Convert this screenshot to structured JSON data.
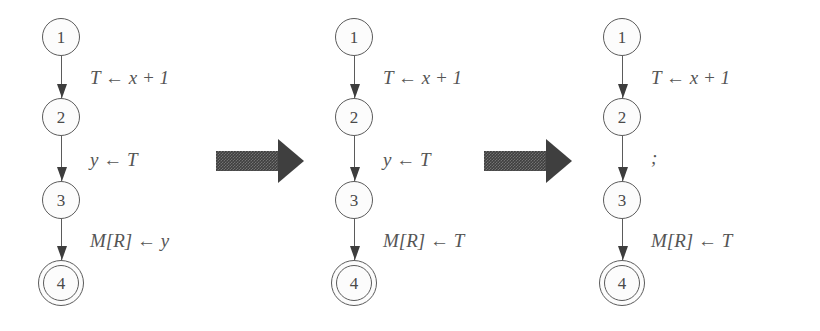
{
  "figure": {
    "background_color": "#ffffff",
    "node_stroke_color": "#5b5b5b",
    "label_color": "#555555",
    "block_arrow_color": "#3f3f3f"
  },
  "panels": [
    {
      "name": "original",
      "nodes": [
        {
          "id": "1",
          "label": "1",
          "accepting": false,
          "x": 61,
          "y": 37
        },
        {
          "id": "2",
          "label": "2",
          "accepting": false,
          "x": 61,
          "y": 117
        },
        {
          "id": "3",
          "label": "3",
          "accepting": false,
          "x": 61,
          "y": 200
        },
        {
          "id": "4",
          "label": "4",
          "accepting": true,
          "x": 61,
          "y": 283
        }
      ],
      "edges": [
        {
          "from": "1",
          "to": "2",
          "label": "T ← x + 1",
          "label_x": 90,
          "label_y": 68
        },
        {
          "from": "2",
          "to": "3",
          "label": "y ← T",
          "label_x": 90,
          "label_y": 150
        },
        {
          "from": "3",
          "to": "4",
          "label": "M[R] ← y",
          "label_x": 90,
          "label_y": 231
        }
      ]
    },
    {
      "name": "after-copy-propagation",
      "nodes": [
        {
          "id": "1",
          "label": "1",
          "accepting": false,
          "x": 354,
          "y": 37
        },
        {
          "id": "2",
          "label": "2",
          "accepting": false,
          "x": 354,
          "y": 117
        },
        {
          "id": "3",
          "label": "3",
          "accepting": false,
          "x": 354,
          "y": 200
        },
        {
          "id": "4",
          "label": "4",
          "accepting": true,
          "x": 354,
          "y": 283
        }
      ],
      "edges": [
        {
          "from": "1",
          "to": "2",
          "label": "T ← x + 1",
          "label_x": 383,
          "label_y": 68
        },
        {
          "from": "2",
          "to": "3",
          "label": "y ← T",
          "label_x": 383,
          "label_y": 150
        },
        {
          "from": "3",
          "to": "4",
          "label": "M[R] ← T",
          "label_x": 383,
          "label_y": 231
        }
      ]
    },
    {
      "name": "after-dead-code-elimination",
      "nodes": [
        {
          "id": "1",
          "label": "1",
          "accepting": false,
          "x": 622,
          "y": 37
        },
        {
          "id": "2",
          "label": "2",
          "accepting": false,
          "x": 622,
          "y": 117
        },
        {
          "id": "3",
          "label": "3",
          "accepting": false,
          "x": 622,
          "y": 200
        },
        {
          "id": "4",
          "label": "4",
          "accepting": true,
          "x": 622,
          "y": 283
        }
      ],
      "edges": [
        {
          "from": "1",
          "to": "2",
          "label": "T ← x + 1",
          "label_x": 651,
          "label_y": 68
        },
        {
          "from": "2",
          "to": "3",
          "label": ";",
          "label_x": 651,
          "label_y": 150
        },
        {
          "from": "3",
          "to": "4",
          "label": "M[R] ← T",
          "label_x": 651,
          "label_y": 231
        }
      ]
    }
  ],
  "transitions": [
    {
      "name": "transition-arrow-1",
      "x": 216,
      "y": 139,
      "shaft_width": 62,
      "total_width": 88
    },
    {
      "name": "transition-arrow-2",
      "x": 484,
      "y": 139,
      "shaft_width": 62,
      "total_width": 88
    }
  ]
}
